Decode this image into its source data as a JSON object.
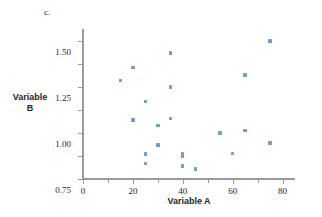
{
  "chart_data": {
    "type": "scatter",
    "title": "c.",
    "xlabel": "Variable A",
    "ylabel": "Variable B",
    "xlim": [
      0,
      85
    ],
    "ylim": [
      0,
      1.62
    ],
    "xticks": [
      0,
      20,
      40,
      60,
      80
    ],
    "xtick_minor": [
      10,
      30,
      50,
      70
    ],
    "yticks": [
      0.0,
      0.25,
      0.5,
      0.75,
      1.0,
      1.25,
      1.5
    ],
    "xtick_labels": [
      "0",
      "20",
      "40",
      "60",
      "80"
    ],
    "ytick_labels": [
      "0.00",
      "0.25",
      "0.50",
      "0.75",
      "1.00",
      "1.25",
      "1.50"
    ],
    "grid": false,
    "legend": null,
    "marker_color": "#6f9fd0",
    "axis_color": "#9a9a9a",
    "points": [
      {
        "x": 15,
        "y": 1.07
      },
      {
        "x": 20,
        "y": 1.21
      },
      {
        "x": 20,
        "y": 0.64
      },
      {
        "x": 25,
        "y": 0.84
      },
      {
        "x": 25,
        "y": 0.27
      },
      {
        "x": 25,
        "y": 0.17
      },
      {
        "x": 30,
        "y": 0.58
      },
      {
        "x": 30,
        "y": 0.37
      },
      {
        "x": 35,
        "y": 1.37
      },
      {
        "x": 35,
        "y": 1.0
      },
      {
        "x": 35,
        "y": 0.66
      },
      {
        "x": 40,
        "y": 0.28
      },
      {
        "x": 40,
        "y": 0.25
      },
      {
        "x": 40,
        "y": 0.14
      },
      {
        "x": 45,
        "y": 0.11
      },
      {
        "x": 55,
        "y": 0.5
      },
      {
        "x": 60,
        "y": 0.28
      },
      {
        "x": 65,
        "y": 1.13
      },
      {
        "x": 65,
        "y": 0.53
      },
      {
        "x": 75,
        "y": 1.5
      },
      {
        "x": 75,
        "y": 0.39
      }
    ]
  },
  "labels": {
    "panel": "c.",
    "y_axis_line1": "Variable",
    "y_axis_line2": "B",
    "x_axis": "Variable A"
  }
}
